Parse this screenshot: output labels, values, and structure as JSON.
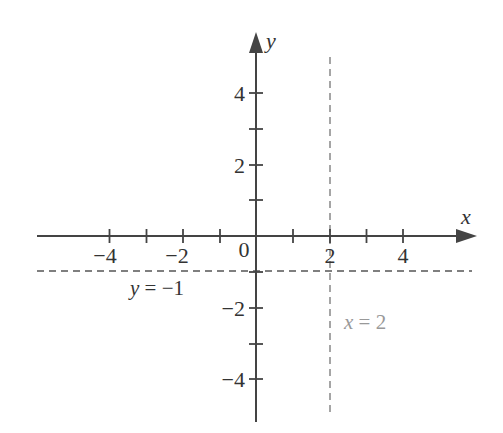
{
  "diagram": {
    "type": "coordinate-plane",
    "colors": {
      "axis": "#444444",
      "text": "#333333",
      "dashed_horizontal": "#555555",
      "dashed_vertical": "#888888",
      "vertical_label": "#999999"
    },
    "axes": {
      "x_label": "x",
      "y_label": "y",
      "origin_label": "0"
    },
    "x_ticks": [
      {
        "value": -4,
        "label": "−4"
      },
      {
        "value": -3,
        "label": ""
      },
      {
        "value": -2,
        "label": "−2"
      },
      {
        "value": -1,
        "label": ""
      },
      {
        "value": 1,
        "label": ""
      },
      {
        "value": 2,
        "label": "2"
      },
      {
        "value": 3,
        "label": ""
      },
      {
        "value": 4,
        "label": "4"
      }
    ],
    "y_ticks": [
      {
        "value": 4,
        "label": "4"
      },
      {
        "value": 3,
        "label": ""
      },
      {
        "value": 2,
        "label": "2"
      },
      {
        "value": 1,
        "label": ""
      },
      {
        "value": -1,
        "label": ""
      },
      {
        "value": -2,
        "label": "−2"
      },
      {
        "value": -3,
        "label": ""
      },
      {
        "value": -4,
        "label": "−4"
      }
    ],
    "lines": [
      {
        "name": "horizontal-asymptote",
        "equation_var": "y",
        "equation_rest": " = −1",
        "style": "dashed",
        "value": -1
      },
      {
        "name": "vertical-asymptote",
        "equation_var": "x",
        "equation_rest": " = 2",
        "style": "dashed",
        "value": 2
      }
    ]
  }
}
